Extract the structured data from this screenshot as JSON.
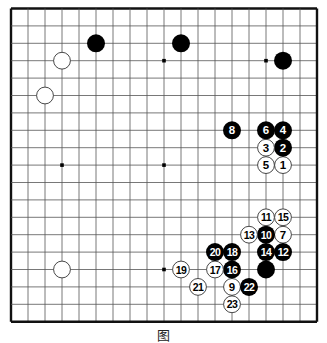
{
  "board": {
    "size": 19,
    "origin_x": 11,
    "origin_y": 8.5,
    "step_x": 17,
    "step_y": 17.4,
    "line_color": "#555555",
    "border_color": "#111111",
    "black_color": "#000000",
    "white_fill": "#ffffff",
    "white_stroke": "#333333",
    "star_points": [
      [
        3,
        3
      ],
      [
        9,
        3
      ],
      [
        15,
        3
      ],
      [
        3,
        9
      ],
      [
        9,
        9
      ],
      [
        15,
        9
      ],
      [
        3,
        15
      ],
      [
        9,
        15
      ],
      [
        15,
        15
      ]
    ]
  },
  "stones": [
    {
      "color": "black",
      "col": 5,
      "row": 2,
      "label": ""
    },
    {
      "color": "black",
      "col": 10,
      "row": 2,
      "label": ""
    },
    {
      "color": "black",
      "col": 16,
      "row": 3,
      "label": ""
    },
    {
      "color": "white",
      "col": 3,
      "row": 3,
      "label": ""
    },
    {
      "color": "white",
      "col": 2,
      "row": 5,
      "label": ""
    },
    {
      "color": "white",
      "col": 3,
      "row": 15,
      "label": ""
    },
    {
      "color": "black",
      "col": 15,
      "row": 15,
      "label": ""
    },
    {
      "color": "white",
      "col": 16,
      "row": 9,
      "label": "1"
    },
    {
      "color": "black",
      "col": 16,
      "row": 8,
      "label": "2"
    },
    {
      "color": "white",
      "col": 15,
      "row": 8,
      "label": "3"
    },
    {
      "color": "black",
      "col": 16,
      "row": 7,
      "label": "4"
    },
    {
      "color": "white",
      "col": 15,
      "row": 9,
      "label": "5"
    },
    {
      "color": "black",
      "col": 15,
      "row": 7,
      "label": "6"
    },
    {
      "color": "white",
      "col": 16,
      "row": 13,
      "label": "7"
    },
    {
      "color": "black",
      "col": 13,
      "row": 7,
      "label": "8"
    },
    {
      "color": "white",
      "col": 13,
      "row": 16,
      "label": "9"
    },
    {
      "color": "black",
      "col": 15,
      "row": 13,
      "label": "10"
    },
    {
      "color": "white",
      "col": 15,
      "row": 12,
      "label": "11"
    },
    {
      "color": "black",
      "col": 16,
      "row": 14,
      "label": "12"
    },
    {
      "color": "white",
      "col": 14,
      "row": 13,
      "label": "13"
    },
    {
      "color": "black",
      "col": 15,
      "row": 14,
      "label": "14"
    },
    {
      "color": "white",
      "col": 16,
      "row": 12,
      "label": "15"
    },
    {
      "color": "black",
      "col": 13,
      "row": 15,
      "label": "16"
    },
    {
      "color": "white",
      "col": 12,
      "row": 15,
      "label": "17"
    },
    {
      "color": "black",
      "col": 13,
      "row": 14,
      "label": "18"
    },
    {
      "color": "white",
      "col": 10,
      "row": 15,
      "label": "19"
    },
    {
      "color": "black",
      "col": 12,
      "row": 14,
      "label": "20"
    },
    {
      "color": "white",
      "col": 11,
      "row": 16,
      "label": "21"
    },
    {
      "color": "black",
      "col": 14,
      "row": 16,
      "label": "22"
    },
    {
      "color": "white",
      "col": 13,
      "row": 17,
      "label": "23"
    }
  ],
  "caption": "图"
}
